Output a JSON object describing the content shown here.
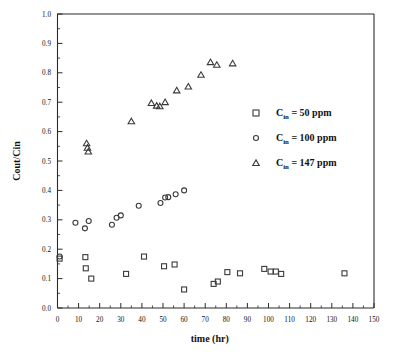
{
  "chart_data": {
    "type": "scatter",
    "title": "",
    "xlabel": "time (hr)",
    "ylabel": "Cout/Cin",
    "xlim": [
      0,
      150
    ],
    "ylim": [
      0.0,
      1.0
    ],
    "xticks": [
      0,
      10,
      20,
      30,
      40,
      50,
      60,
      70,
      80,
      90,
      100,
      110,
      120,
      130,
      140,
      150
    ],
    "xticklabels": [
      "0",
      "10",
      "20",
      "30",
      "40",
      "50",
      "60",
      "70",
      "80",
      "90",
      "100",
      "110",
      "120",
      "130",
      "140",
      "150"
    ],
    "yticks": [
      0.0,
      0.1,
      0.2,
      0.3,
      0.4,
      0.5,
      0.6,
      0.7,
      0.8,
      0.9,
      1.0
    ],
    "yticklabels": [
      "0.0",
      "0.1",
      "0.2",
      "0.3",
      "0.4",
      "0.5",
      "0.6",
      "0.7",
      "0.8",
      "0.9",
      "1.0"
    ],
    "grid": false,
    "minor_ticks": true,
    "legend_position": "right",
    "series": [
      {
        "name": "Cin = 50 ppm",
        "marker": "square",
        "legend_prefix": "C",
        "legend_sub": "in",
        "legend_suffix": " =  50  ppm",
        "points": [
          {
            "x": 1.0,
            "y": 0.168
          },
          {
            "x": 13.2,
            "y": 0.173
          },
          {
            "x": 13.4,
            "y": 0.135
          },
          {
            "x": 16.0,
            "y": 0.1
          },
          {
            "x": 32.5,
            "y": 0.116
          },
          {
            "x": 41.0,
            "y": 0.175
          },
          {
            "x": 50.5,
            "y": 0.142
          },
          {
            "x": 55.5,
            "y": 0.148
          },
          {
            "x": 60.0,
            "y": 0.063
          },
          {
            "x": 74.0,
            "y": 0.082
          },
          {
            "x": 76.0,
            "y": 0.09
          },
          {
            "x": 80.5,
            "y": 0.122
          },
          {
            "x": 86.5,
            "y": 0.118
          },
          {
            "x": 98.0,
            "y": 0.133
          },
          {
            "x": 101.0,
            "y": 0.124
          },
          {
            "x": 103.5,
            "y": 0.124
          },
          {
            "x": 106.0,
            "y": 0.116
          },
          {
            "x": 136.0,
            "y": 0.118
          }
        ]
      },
      {
        "name": "Cin = 100 ppm",
        "marker": "circle",
        "legend_prefix": "C",
        "legend_sub": "in",
        "legend_suffix": " =  100  ppm",
        "points": [
          {
            "x": 1.0,
            "y": 0.175
          },
          {
            "x": 8.5,
            "y": 0.29
          },
          {
            "x": 13.0,
            "y": 0.271
          },
          {
            "x": 14.8,
            "y": 0.296
          },
          {
            "x": 25.8,
            "y": 0.283
          },
          {
            "x": 28.0,
            "y": 0.307
          },
          {
            "x": 30.0,
            "y": 0.315
          },
          {
            "x": 38.5,
            "y": 0.348
          },
          {
            "x": 48.8,
            "y": 0.357
          },
          {
            "x": 51.0,
            "y": 0.376
          },
          {
            "x": 52.5,
            "y": 0.377
          },
          {
            "x": 56.0,
            "y": 0.387
          },
          {
            "x": 60.0,
            "y": 0.4
          }
        ]
      },
      {
        "name": "Cin = 147 ppm",
        "marker": "triangle",
        "legend_prefix": "C",
        "legend_sub": "in",
        "legend_suffix": " =  147  ppm",
        "points": [
          {
            "x": 13.8,
            "y": 0.56
          },
          {
            "x": 14.2,
            "y": 0.545
          },
          {
            "x": 14.6,
            "y": 0.532
          },
          {
            "x": 35.0,
            "y": 0.635
          },
          {
            "x": 44.5,
            "y": 0.697
          },
          {
            "x": 47.0,
            "y": 0.688
          },
          {
            "x": 48.5,
            "y": 0.686
          },
          {
            "x": 51.0,
            "y": 0.7
          },
          {
            "x": 56.5,
            "y": 0.74
          },
          {
            "x": 62.0,
            "y": 0.753
          },
          {
            "x": 68.0,
            "y": 0.793
          },
          {
            "x": 72.5,
            "y": 0.836
          },
          {
            "x": 75.5,
            "y": 0.827
          },
          {
            "x": 83.0,
            "y": 0.832
          }
        ]
      }
    ]
  },
  "legend": {
    "entries": [
      {
        "marker": "square",
        "prefix": "C",
        "sub": "in",
        "text": " =  50  ppm"
      },
      {
        "marker": "circle",
        "prefix": "C",
        "sub": "in",
        "text": " =  100  ppm"
      },
      {
        "marker": "triangle",
        "prefix": "C",
        "sub": "in",
        "text": " =  147  ppm"
      }
    ]
  }
}
